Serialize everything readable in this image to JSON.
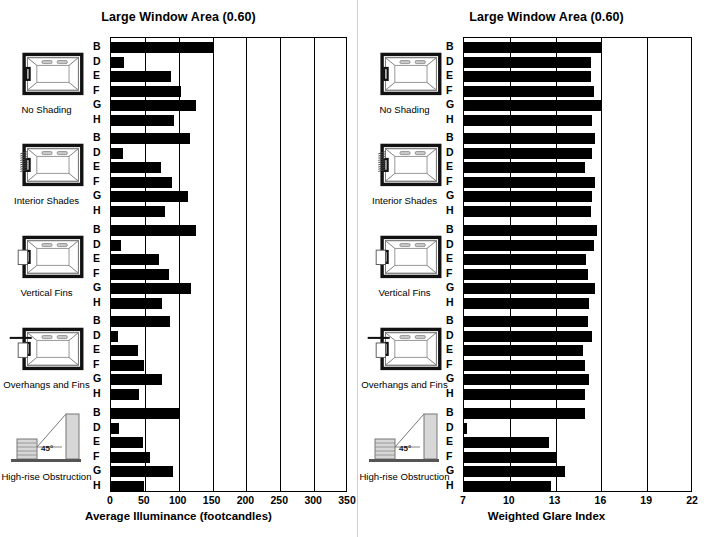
{
  "panels": [
    {
      "id": "left",
      "title": "Large Window Area (0.60)",
      "xlabel": "Average Illuminance (footcandles)",
      "chart_data": {
        "type": "bar",
        "orientation": "horizontal",
        "title": "Large Window Area (0.60)",
        "xlabel": "Average Illuminance (footcandles)",
        "ylabel": "",
        "xlim": [
          0,
          350
        ],
        "xticks": [
          0,
          50,
          100,
          150,
          200,
          250,
          300,
          350
        ],
        "grid": true,
        "categories": [
          "B",
          "D",
          "E",
          "F",
          "G",
          "H"
        ],
        "groups": [
          {
            "name": "No Shading",
            "values": [
              150,
              19,
              88,
              103,
              125,
              93
            ]
          },
          {
            "name": "Interior Shades",
            "values": [
              116,
              18,
              74,
              90,
              113,
              80
            ]
          },
          {
            "name": "Vertical Fins",
            "values": [
              126,
              15,
              71,
              85,
              118,
              75
            ]
          },
          {
            "name": "Overhangs and Fins",
            "values": [
              87,
              10,
              40,
              48,
              75,
              42
            ]
          },
          {
            "name": "High-rise Obstruction",
            "values": [
              100,
              12,
              47,
              57,
              92,
              48
            ]
          }
        ]
      }
    },
    {
      "id": "right",
      "title": "Large Window Area (0.60)",
      "xlabel": "Weighted Glare Index",
      "chart_data": {
        "type": "bar",
        "orientation": "horizontal",
        "title": "Large Window Area (0.60)",
        "xlabel": "Weighted Glare Index",
        "ylabel": "",
        "xlim": [
          7,
          22
        ],
        "xticks": [
          7,
          10,
          13,
          16,
          19,
          22
        ],
        "grid": true,
        "categories": [
          "B",
          "D",
          "E",
          "F",
          "G",
          "H"
        ],
        "groups": [
          {
            "name": "No Shading",
            "values": [
              16.0,
              15.3,
              15.3,
              15.5,
              16.0,
              15.4
            ]
          },
          {
            "name": "Interior Shades",
            "values": [
              15.6,
              15.4,
              14.9,
              15.6,
              15.4,
              15.3
            ]
          },
          {
            "name": "Vertical Fins",
            "values": [
              15.7,
              15.5,
              15.0,
              15.1,
              15.6,
              15.2
            ]
          },
          {
            "name": "Overhangs and Fins",
            "values": [
              15.1,
              15.4,
              14.8,
              14.9,
              15.2,
              14.9
            ]
          },
          {
            "name": "High-rise Obstruction",
            "values": [
              14.9,
              7.2,
              12.6,
              13.0,
              13.6,
              12.7
            ]
          }
        ]
      }
    }
  ],
  "row_groups": [
    {
      "name": "No Shading",
      "caption": "No Shading",
      "icon": "room-no-shading-icon"
    },
    {
      "name": "Interior Shades",
      "caption": "Interior Shades",
      "icon": "room-interior-shades-icon"
    },
    {
      "name": "Vertical Fins",
      "caption": "Vertical Fins",
      "icon": "room-vertical-fins-icon"
    },
    {
      "name": "Overhangs and Fins",
      "caption": "Overhangs and Fins",
      "icon": "room-overhangs-and-fins-icon"
    },
    {
      "name": "High-rise Obstruction",
      "caption": "High-rise Obstruction",
      "icon": "high-rise-obstruction-icon",
      "angle_label": "45°"
    }
  ],
  "colors": {
    "bar": "#000000",
    "frame": "#000000",
    "grid": "#000000",
    "background": "#ffffff"
  }
}
